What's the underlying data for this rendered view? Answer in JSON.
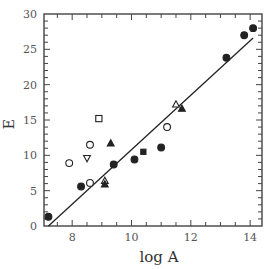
{
  "chart_data": {
    "type": "scatter",
    "title": "",
    "xlabel": "log A",
    "ylabel": "E",
    "xlim": [
      7.05,
      14.4
    ],
    "ylim": [
      0,
      30
    ],
    "xticks": [
      8,
      10,
      12,
      14
    ],
    "yticks": [
      0,
      5,
      10,
      15,
      20,
      25,
      30
    ],
    "grid": false,
    "legend": null,
    "series": [
      {
        "name": "filled-circle",
        "marker": "circle",
        "filled": true,
        "points": [
          [
            7.2,
            1.3
          ],
          [
            8.3,
            5.6
          ],
          [
            9.4,
            8.7
          ],
          [
            10.1,
            9.4
          ],
          [
            11.0,
            11.1
          ],
          [
            13.2,
            23.8
          ],
          [
            13.8,
            27.0
          ],
          [
            14.1,
            28.0
          ]
        ]
      },
      {
        "name": "open-circle",
        "marker": "circle",
        "filled": false,
        "points": [
          [
            7.9,
            8.9
          ],
          [
            8.6,
            11.5
          ],
          [
            8.6,
            6.1
          ],
          [
            11.2,
            14.0
          ]
        ]
      },
      {
        "name": "open-square",
        "marker": "square",
        "filled": false,
        "points": [
          [
            8.9,
            15.2
          ]
        ]
      },
      {
        "name": "filled-square",
        "marker": "square",
        "filled": true,
        "points": [
          [
            10.4,
            10.5
          ]
        ]
      },
      {
        "name": "open-down-triangle",
        "marker": "triangle-down",
        "filled": false,
        "points": [
          [
            8.5,
            9.6
          ]
        ]
      },
      {
        "name": "open-up-triangle",
        "marker": "triangle-up",
        "filled": false,
        "points": [
          [
            9.1,
            6.4
          ],
          [
            11.5,
            17.2
          ]
        ]
      },
      {
        "name": "filled-up-triangle",
        "marker": "triangle-up",
        "filled": true,
        "points": [
          [
            9.1,
            5.9
          ],
          [
            9.3,
            11.7
          ],
          [
            11.7,
            16.6
          ]
        ]
      }
    ],
    "fit_line": {
      "x": [
        7.2,
        14.1
      ],
      "y": [
        0.0,
        26.6
      ]
    }
  }
}
